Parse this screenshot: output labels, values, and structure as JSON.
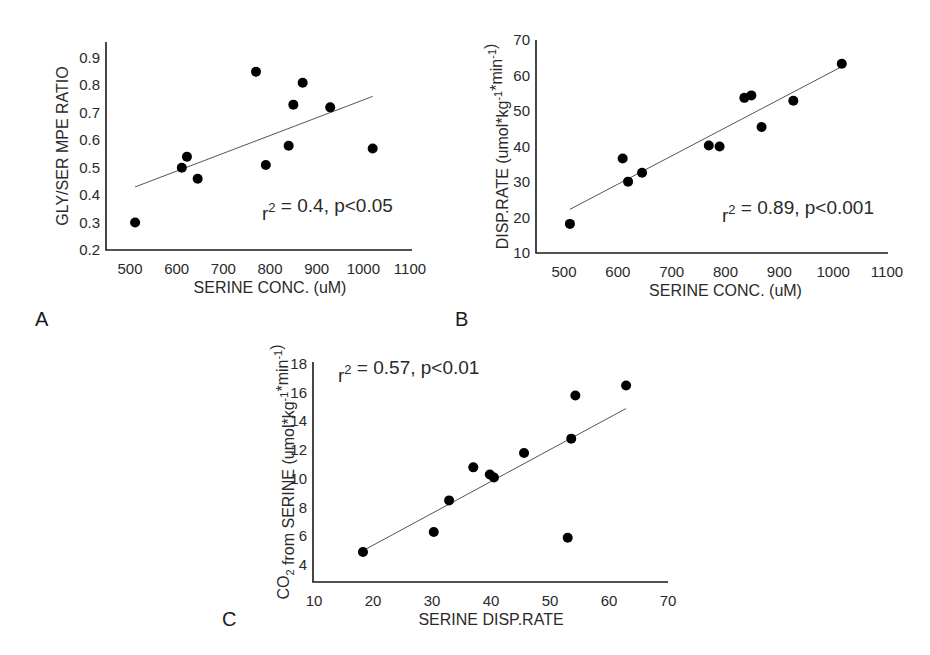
{
  "chart_data": [
    {
      "id": "A",
      "type": "scatter",
      "panel_label": "A",
      "title": "",
      "xlabel": "SERINE CONC. (uM)",
      "ylabel": "GLY/SER MPE RATIO",
      "xlim": [
        450,
        1100
      ],
      "ylim": [
        0.2,
        0.9
      ],
      "xticks": [
        500,
        600,
        700,
        800,
        900,
        1000,
        1100
      ],
      "yticks": [
        0.2,
        0.3,
        0.4,
        0.5,
        0.6,
        0.7,
        0.8,
        0.9
      ],
      "ytick_labels": [
        "0.2",
        "0.3",
        "0.4",
        "0.5",
        "0.6",
        "0.7",
        "0.8",
        "0.9"
      ],
      "grid": false,
      "annotation": "r² = 0.4, p<0.05",
      "points": [
        {
          "x": 511,
          "y": 0.3
        },
        {
          "x": 611,
          "y": 0.5
        },
        {
          "x": 622,
          "y": 0.54
        },
        {
          "x": 645,
          "y": 0.46
        },
        {
          "x": 770,
          "y": 0.85
        },
        {
          "x": 791,
          "y": 0.51
        },
        {
          "x": 840,
          "y": 0.58
        },
        {
          "x": 850,
          "y": 0.73
        },
        {
          "x": 870,
          "y": 0.81
        },
        {
          "x": 929,
          "y": 0.72
        },
        {
          "x": 1020,
          "y": 0.57
        }
      ],
      "trendline": {
        "x1": 511,
        "y1": 0.43,
        "x2": 1020,
        "y2": 0.76
      }
    },
    {
      "id": "B",
      "type": "scatter",
      "panel_label": "B",
      "title": "",
      "xlabel": "SERINE CONC. (uM)",
      "ylabel": "DISP.RATE (umol*kg⁻¹*min⁻¹)",
      "xlim": [
        450,
        1100
      ],
      "ylim": [
        10,
        70
      ],
      "xticks": [
        500,
        600,
        700,
        800,
        900,
        1000,
        1100
      ],
      "yticks": [
        10,
        20,
        30,
        40,
        50,
        60,
        70
      ],
      "ytick_labels": [
        "10",
        "20",
        "30",
        "40",
        "50",
        "60",
        "70"
      ],
      "grid": false,
      "annotation": "r² = 0.89, p<0.001",
      "points": [
        {
          "x": 511,
          "y": 18.2
        },
        {
          "x": 609,
          "y": 36.6
        },
        {
          "x": 619,
          "y": 30.1
        },
        {
          "x": 645,
          "y": 32.6
        },
        {
          "x": 769,
          "y": 40.3
        },
        {
          "x": 789,
          "y": 40.0
        },
        {
          "x": 835,
          "y": 53.7
        },
        {
          "x": 848,
          "y": 54.4
        },
        {
          "x": 867,
          "y": 45.5
        },
        {
          "x": 926,
          "y": 52.9
        },
        {
          "x": 1016,
          "y": 63.3
        }
      ],
      "trendline": {
        "x1": 511,
        "y1": 22.3,
        "x2": 1016,
        "y2": 62.5
      }
    },
    {
      "id": "C",
      "type": "scatter",
      "panel_label": "C",
      "title": "",
      "xlabel": "SERINE DISP.RATE",
      "ylabel": "CO₂ from SERINE (umol*kg⁻¹*min⁻¹)",
      "xlim": [
        10,
        70
      ],
      "ylim": [
        3,
        18
      ],
      "xticks": [
        10,
        20,
        30,
        40,
        50,
        60,
        70
      ],
      "yticks": [
        4,
        6,
        8,
        10,
        12,
        14,
        16,
        18
      ],
      "ytick_labels": [
        "4",
        "6",
        "8",
        "10",
        "12",
        "14",
        "16",
        "18"
      ],
      "grid": false,
      "annotation": "r² = 0.57, p<0.01",
      "points": [
        {
          "x": 18.3,
          "y": 4.9
        },
        {
          "x": 30.3,
          "y": 6.3
        },
        {
          "x": 32.9,
          "y": 8.5
        },
        {
          "x": 37.0,
          "y": 10.8
        },
        {
          "x": 39.8,
          "y": 10.3
        },
        {
          "x": 40.5,
          "y": 10.1
        },
        {
          "x": 45.6,
          "y": 11.8
        },
        {
          "x": 53.0,
          "y": 5.9
        },
        {
          "x": 53.6,
          "y": 12.8
        },
        {
          "x": 54.3,
          "y": 15.8
        },
        {
          "x": 62.9,
          "y": 16.5
        }
      ],
      "trendline": {
        "x1": 18.3,
        "y1": 5.0,
        "x2": 62.9,
        "y2": 14.9
      }
    }
  ],
  "layout": {
    "A": {
      "x0": 106,
      "y0": 250,
      "x_min_px": 130,
      "x_max_px": 410,
      "x_min_val": 500,
      "x_max_val": 1100,
      "y_min_px": 250,
      "y_max_px": 58,
      "y_min_val": 0.2,
      "y_max_val": 0.9,
      "axis_top": 42,
      "axis_right": 412,
      "label_pos": [
        35,
        326
      ]
    },
    "B": {
      "x0": 536,
      "y0": 253,
      "x_min_px": 564,
      "x_max_px": 887,
      "x_min_val": 500,
      "x_max_val": 1100,
      "y_min_px": 253,
      "y_max_px": 40,
      "y_min_val": 10,
      "y_max_val": 70,
      "axis_top": 40,
      "axis_right": 888,
      "label_pos": [
        455,
        326
      ]
    },
    "C": {
      "x0": 313,
      "y0": 582,
      "x_min_px": 314,
      "x_max_px": 668,
      "x_min_val": 10,
      "x_max_val": 70,
      "y_min_px": 565,
      "y_max_px": 364,
      "y_min_val": 4,
      "y_max_val": 18,
      "axis_top": 362,
      "axis_right": 668,
      "label_pos": [
        222,
        626
      ]
    }
  }
}
